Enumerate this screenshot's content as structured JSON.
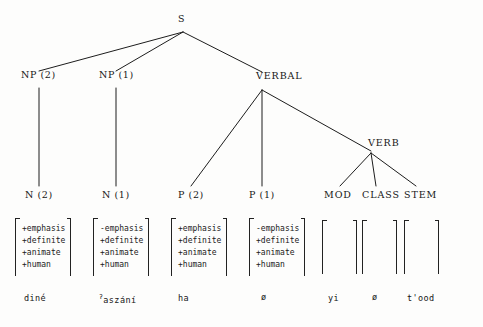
{
  "diagram": {
    "kind": "syntactic-tree-with-feature-matrices",
    "language_example": "Navajo",
    "nodes": {
      "s": "S",
      "np2": "NP (2)",
      "np1": "NP (1)",
      "verbal": "VERBAL",
      "verb": "VERB",
      "n2": "N (2)",
      "n1": "N (1)",
      "p2": "P (2)",
      "p1": "P (1)",
      "mod": "MOD",
      "class": "CLASS",
      "stem": "STEM"
    },
    "matrices": [
      {
        "id": "matrix-n2",
        "features": [
          "+emphasis",
          "+definite",
          "+animate",
          "+human"
        ],
        "word": "diné",
        "word_prefix": "",
        "empty": false
      },
      {
        "id": "matrix-n1",
        "features": [
          "-emphasis",
          "+definite",
          "+animate",
          "+human"
        ],
        "word": "aszání",
        "word_prefix": "ʔ",
        "empty": false
      },
      {
        "id": "matrix-p2",
        "features": [
          "+emphasis",
          "+definite",
          "+animate",
          "+human"
        ],
        "word": "ha",
        "word_prefix": "",
        "empty": false
      },
      {
        "id": "matrix-p1",
        "features": [
          "-emphasis",
          "+definite",
          "+animate",
          "+human"
        ],
        "word": "ø",
        "word_prefix": "",
        "empty": false
      },
      {
        "id": "matrix-mod",
        "features": [],
        "word": "yi",
        "word_prefix": "",
        "empty": true
      },
      {
        "id": "matrix-class",
        "features": [],
        "word": "ø",
        "word_prefix": "",
        "empty": true
      },
      {
        "id": "matrix-stem",
        "features": [],
        "word": "t'ood",
        "word_prefix": "",
        "empty": true
      }
    ],
    "colors": {
      "ink": "#1a1a1a",
      "background": "#fdfdfc"
    }
  }
}
